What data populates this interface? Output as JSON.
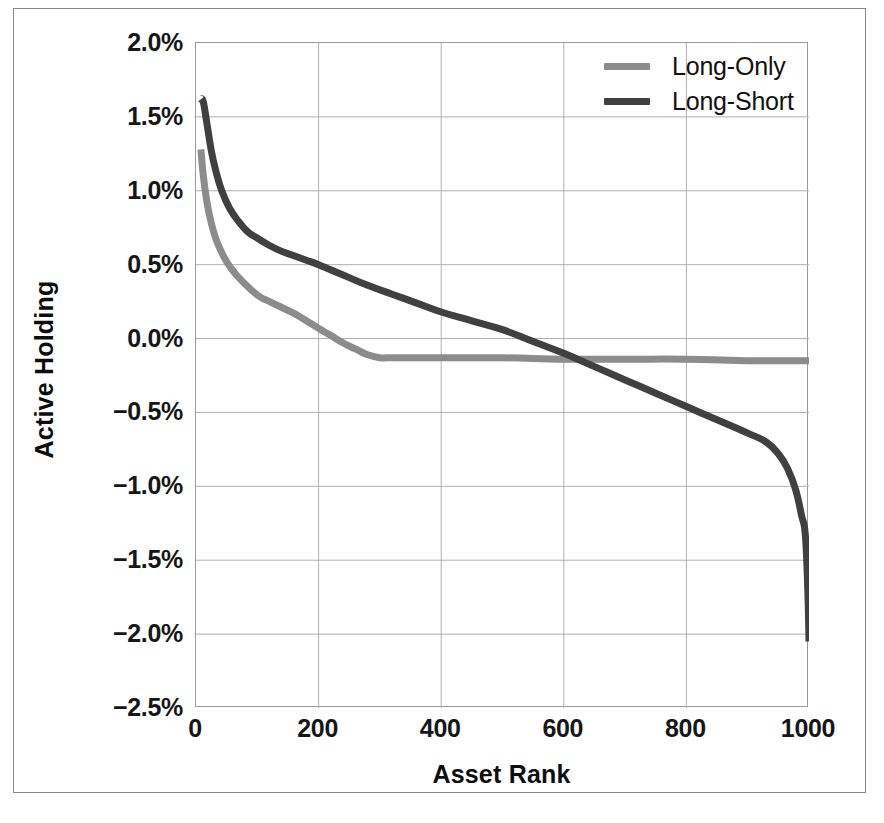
{
  "figure": {
    "background": "#ffffff",
    "frame_color": "#8a8a8a"
  },
  "chart_data": {
    "type": "line",
    "title": "",
    "xlabel": "Asset Rank",
    "ylabel": "Active Holding",
    "xlim": [
      0,
      1000
    ],
    "ylim": [
      -2.5,
      2.0
    ],
    "grid": true,
    "grid_color": "#b0b0b0",
    "legend_position": "top-right",
    "x_ticks": [
      0,
      200,
      400,
      600,
      800,
      1000
    ],
    "x_tick_labels": [
      "0",
      "200",
      "400",
      "600",
      "800",
      "1000"
    ],
    "y_ticks": [
      2.0,
      1.5,
      1.0,
      0.5,
      0.0,
      -0.5,
      -1.0,
      -1.5,
      -2.0,
      -2.5
    ],
    "y_tick_labels": [
      "2.0%",
      "1.5%",
      "1.0%",
      "0.5%",
      "0.0%",
      "-0.5%",
      "-1.0%",
      "-1.5%",
      "-2.0%",
      "-2.5%"
    ],
    "series": [
      {
        "name": "Long-Only",
        "color": "#8c8c8c",
        "linewidth": 7,
        "x": [
          8,
          12,
          18,
          25,
          32,
          40,
          50,
          62,
          75,
          90,
          105,
          120,
          140,
          160,
          180,
          200,
          220,
          240,
          260,
          280,
          300,
          312,
          330,
          400,
          500,
          600,
          700,
          800,
          900,
          960,
          1000
        ],
        "y": [
          1.28,
          1.1,
          0.92,
          0.78,
          0.68,
          0.6,
          0.52,
          0.45,
          0.39,
          0.33,
          0.28,
          0.25,
          0.21,
          0.17,
          0.12,
          0.07,
          0.02,
          -0.03,
          -0.07,
          -0.11,
          -0.13,
          -0.13,
          -0.13,
          -0.13,
          -0.13,
          -0.14,
          -0.14,
          -0.14,
          -0.15,
          -0.15,
          -0.15
        ]
      },
      {
        "name": "Long-Short",
        "color": "#404040",
        "linewidth": 7,
        "x": [
          8,
          12,
          18,
          25,
          32,
          42,
          55,
          70,
          85,
          100,
          120,
          140,
          160,
          180,
          200,
          240,
          280,
          320,
          360,
          400,
          450,
          500,
          550,
          600,
          650,
          700,
          750,
          800,
          850,
          900,
          930,
          950,
          965,
          978,
          988,
          994,
          998,
          1000
        ],
        "y": [
          1.62,
          1.6,
          1.45,
          1.27,
          1.14,
          1.0,
          0.88,
          0.79,
          0.72,
          0.68,
          0.63,
          0.59,
          0.56,
          0.53,
          0.5,
          0.43,
          0.36,
          0.3,
          0.24,
          0.18,
          0.12,
          0.06,
          -0.02,
          -0.1,
          -0.19,
          -0.28,
          -0.37,
          -0.46,
          -0.55,
          -0.64,
          -0.7,
          -0.78,
          -0.88,
          -1.02,
          -1.2,
          -1.33,
          -1.7,
          -2.05
        ]
      }
    ]
  },
  "legend": {
    "items": [
      {
        "label": "Long-Only",
        "color": "#8c8c8c"
      },
      {
        "label": "Long-Short",
        "color": "#404040"
      }
    ]
  }
}
